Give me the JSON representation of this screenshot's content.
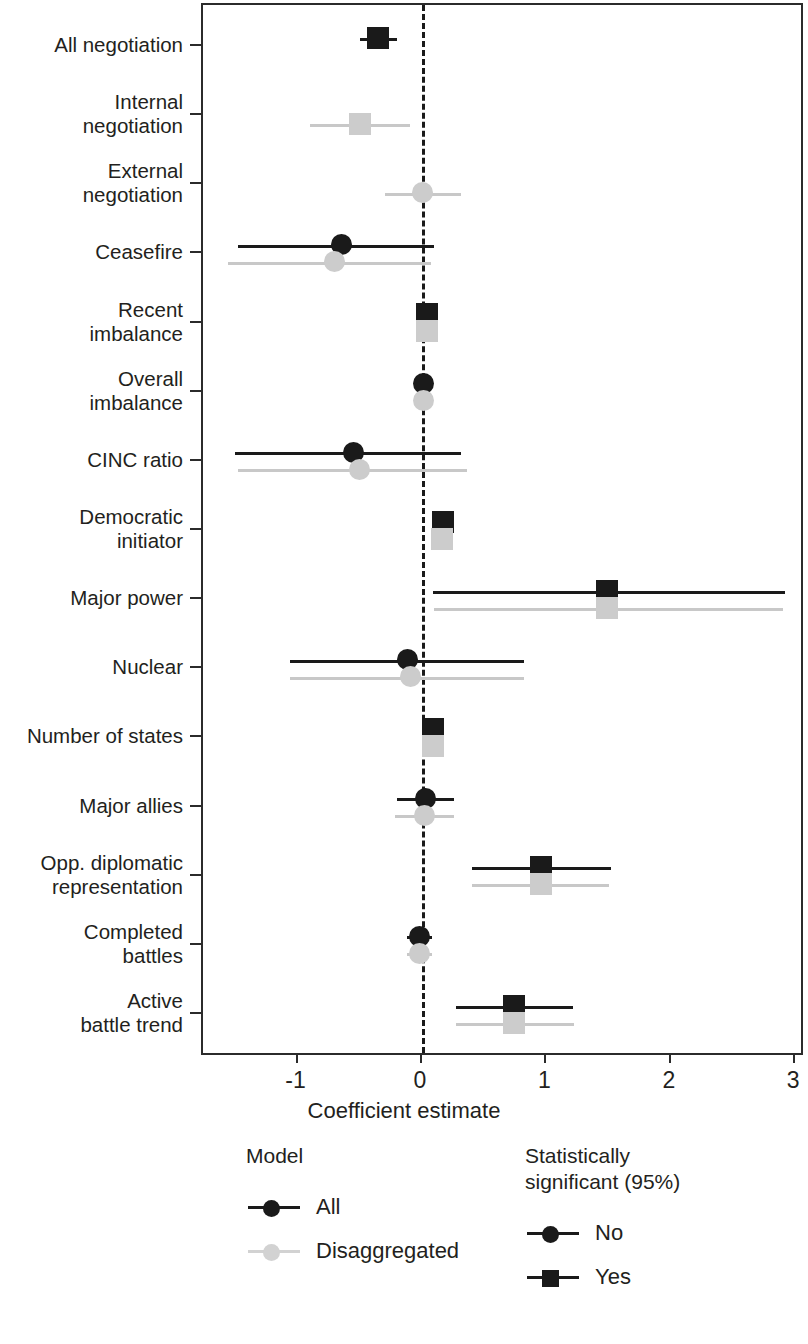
{
  "chart_data": {
    "type": "scatter",
    "subtype": "coefficient-forest-plot",
    "title": "",
    "xlabel": "Coefficient estimate",
    "ylabel": "",
    "xlim": [
      -1.76,
      3.08
    ],
    "xticks": [
      -1,
      0,
      1,
      2,
      3
    ],
    "xticklabels": [
      "-1",
      "0",
      "1",
      "2",
      "3"
    ],
    "grid": false,
    "reference_line": {
      "x": 0,
      "style": "dashed",
      "color": "#1a1a1a"
    },
    "categories": [
      "All negotiation",
      "Internal\nnegotiation",
      "External\nnegotiation",
      "Ceasefire",
      "Recent\nimbalance",
      "Overall\nimbalance",
      "CINC ratio",
      "Democratic\ninitiator",
      "Major power",
      "Nuclear",
      "Number of states",
      "Major allies",
      "Opp. diplomatic\nrepresentation",
      "Completed\nbattles",
      "Active\nbattle trend"
    ],
    "series": [
      {
        "name": "All",
        "color": "#1a1a1a",
        "points": [
          {
            "category": "All negotiation",
            "estimate": -0.35,
            "ci_low": -0.5,
            "ci_high": -0.2,
            "significant": true
          },
          {
            "category": "Internal\nnegotiation",
            "estimate": null,
            "ci_low": null,
            "ci_high": null,
            "significant": null
          },
          {
            "category": "External\nnegotiation",
            "estimate": null,
            "ci_low": null,
            "ci_high": null,
            "significant": null
          },
          {
            "category": "Ceasefire",
            "estimate": -0.65,
            "ci_low": -1.48,
            "ci_high": 0.1,
            "significant": false
          },
          {
            "category": "Recent\nimbalance",
            "estimate": 0.04,
            "ci_low": -0.03,
            "ci_high": 0.11,
            "significant": true
          },
          {
            "category": "Overall\nimbalance",
            "estimate": 0.01,
            "ci_low": -0.05,
            "ci_high": 0.07,
            "significant": false
          },
          {
            "category": "CINC ratio",
            "estimate": -0.55,
            "ci_low": -1.5,
            "ci_high": 0.31,
            "significant": false
          },
          {
            "category": "Democratic\ninitiator",
            "estimate": 0.17,
            "ci_low": 0.09,
            "ci_high": 0.26,
            "significant": true
          },
          {
            "category": "Major power",
            "estimate": 1.49,
            "ci_low": 0.09,
            "ci_high": 2.92,
            "significant": true
          },
          {
            "category": "Nuclear",
            "estimate": -0.12,
            "ci_low": -1.06,
            "ci_high": 0.82,
            "significant": false
          },
          {
            "category": "Number of states",
            "estimate": 0.09,
            "ci_low": 0.01,
            "ci_high": 0.18,
            "significant": true
          },
          {
            "category": "Major allies",
            "estimate": 0.03,
            "ci_low": -0.2,
            "ci_high": 0.26,
            "significant": false
          },
          {
            "category": "Opp. diplomatic\nrepresentation",
            "estimate": 0.96,
            "ci_low": 0.4,
            "ci_high": 1.52,
            "significant": true
          },
          {
            "category": "Completed\nbattles",
            "estimate": -0.02,
            "ci_low": -0.12,
            "ci_high": 0.08,
            "significant": false
          },
          {
            "category": "Active\nbattle trend",
            "estimate": 0.74,
            "ci_low": 0.27,
            "ci_high": 1.21,
            "significant": true
          }
        ]
      },
      {
        "name": "Disaggregated",
        "color": "#cccccc",
        "points": [
          {
            "category": "All negotiation",
            "estimate": null,
            "ci_low": null,
            "ci_high": null,
            "significant": null
          },
          {
            "category": "Internal\nnegotiation",
            "estimate": -0.5,
            "ci_low": -0.9,
            "ci_high": -0.1,
            "significant": true
          },
          {
            "category": "External\nnegotiation",
            "estimate": 0.0,
            "ci_low": -0.3,
            "ci_high": 0.31,
            "significant": false
          },
          {
            "category": "Ceasefire",
            "estimate": -0.7,
            "ci_low": -1.56,
            "ci_high": 0.07,
            "significant": false
          },
          {
            "category": "Recent\nimbalance",
            "estimate": 0.04,
            "ci_low": -0.03,
            "ci_high": 0.11,
            "significant": true
          },
          {
            "category": "Overall\nimbalance",
            "estimate": 0.01,
            "ci_low": -0.05,
            "ci_high": 0.07,
            "significant": false
          },
          {
            "category": "CINC ratio",
            "estimate": -0.5,
            "ci_low": -1.48,
            "ci_high": 0.36,
            "significant": false
          },
          {
            "category": "Democratic\ninitiator",
            "estimate": 0.16,
            "ci_low": 0.07,
            "ci_high": 0.25,
            "significant": true
          },
          {
            "category": "Major power",
            "estimate": 1.49,
            "ci_low": 0.1,
            "ci_high": 2.9,
            "significant": true
          },
          {
            "category": "Nuclear",
            "estimate": -0.09,
            "ci_low": -1.06,
            "ci_high": 0.82,
            "significant": false
          },
          {
            "category": "Number of states",
            "estimate": 0.09,
            "ci_low": 0.01,
            "ci_high": 0.18,
            "significant": true
          },
          {
            "category": "Major allies",
            "estimate": 0.02,
            "ci_low": -0.22,
            "ci_high": 0.26,
            "significant": false
          },
          {
            "category": "Opp. diplomatic\nrepresentation",
            "estimate": 0.96,
            "ci_low": 0.4,
            "ci_high": 1.5,
            "significant": true
          },
          {
            "category": "Completed\nbattles",
            "estimate": -0.02,
            "ci_low": -0.12,
            "ci_high": 0.08,
            "significant": false
          },
          {
            "category": "Active\nbattle trend",
            "estimate": 0.74,
            "ci_low": 0.27,
            "ci_high": 1.22,
            "significant": true
          }
        ]
      }
    ]
  },
  "legends": [
    {
      "id": "model",
      "title": "Model",
      "items": [
        {
          "label": "All",
          "shape": "circle",
          "color": "#1a1a1a"
        },
        {
          "label": "Disaggregated",
          "shape": "circle",
          "color": "#d2d2d2"
        }
      ]
    },
    {
      "id": "significance",
      "title": "Statistically\nsignificant (95%)",
      "items": [
        {
          "label": "No",
          "shape": "circle",
          "color": "#1a1a1a"
        },
        {
          "label": "Yes",
          "shape": "square",
          "color": "#1a1a1a"
        }
      ]
    }
  ]
}
